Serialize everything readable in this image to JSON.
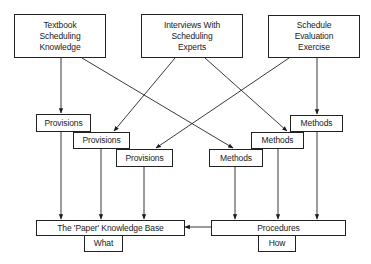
{
  "sources": {
    "textbook": [
      "Textbook",
      "Scheduling",
      "Knowledge"
    ],
    "interviews": [
      "Interviews With",
      "Scheduling",
      "Experts"
    ],
    "evaluation": [
      "Schedule",
      "Evaluation",
      "Exercise"
    ]
  },
  "provisions": [
    "Provisions",
    "Provisions",
    "Provisions"
  ],
  "methods": [
    "Methods",
    "Methods",
    "Methods"
  ],
  "knowledge_base": {
    "title": "The 'Paper' Knowledge Base",
    "tab": "What"
  },
  "procedures": {
    "title": "Procedures",
    "tab": "How"
  },
  "edges": [
    {
      "from": "Textbook Scheduling Knowledge",
      "to": "Provisions 1"
    },
    {
      "from": "Textbook Scheduling Knowledge",
      "to": "Methods 1"
    },
    {
      "from": "Interviews With Scheduling Experts",
      "to": "Provisions 2"
    },
    {
      "from": "Interviews With Scheduling Experts",
      "to": "Methods 2"
    },
    {
      "from": "Schedule Evaluation Exercise",
      "to": "Provisions 3"
    },
    {
      "from": "Schedule Evaluation Exercise",
      "to": "Methods 3"
    },
    {
      "from": "Provisions 1",
      "to": "The 'Paper' Knowledge Base"
    },
    {
      "from": "Provisions 2",
      "to": "The 'Paper' Knowledge Base"
    },
    {
      "from": "Provisions 3",
      "to": "The 'Paper' Knowledge Base"
    },
    {
      "from": "Methods 1",
      "to": "Procedures"
    },
    {
      "from": "Methods 2",
      "to": "Procedures"
    },
    {
      "from": "Methods 3",
      "to": "Procedures"
    },
    {
      "from": "Procedures",
      "to": "The 'Paper' Knowledge Base"
    }
  ]
}
